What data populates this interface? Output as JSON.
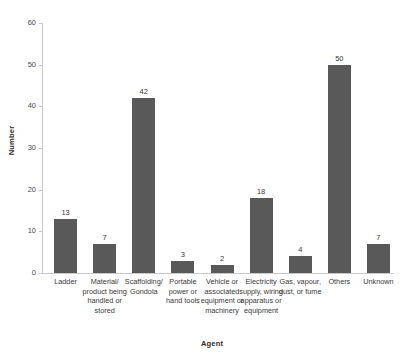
{
  "chart_data": {
    "type": "bar",
    "title": "",
    "xlabel": "Agent",
    "ylabel": "Number",
    "ylim": [
      0,
      60
    ],
    "yticks": [
      0,
      10,
      20,
      30,
      40,
      50,
      60
    ],
    "grid": false,
    "legend": "none",
    "bar_color": "#595959",
    "axis_color": "#c9c9c9",
    "categories": [
      "Ladder",
      "Material/ product being handled or stored",
      "Scaffolding/ Gondola",
      "Portable power or hand tools",
      "Vehicle or associated equipment or machinery",
      "Electricity supply, wiring apparatus or equipment",
      "Gas, vapour, dust, or fume",
      "Others",
      "Unknown"
    ],
    "values": [
      13,
      7,
      42,
      3,
      2,
      18,
      4,
      50,
      7
    ],
    "value_labels": [
      "13",
      "7",
      "42",
      "3",
      "2",
      "18",
      "4",
      "50",
      "7"
    ]
  }
}
